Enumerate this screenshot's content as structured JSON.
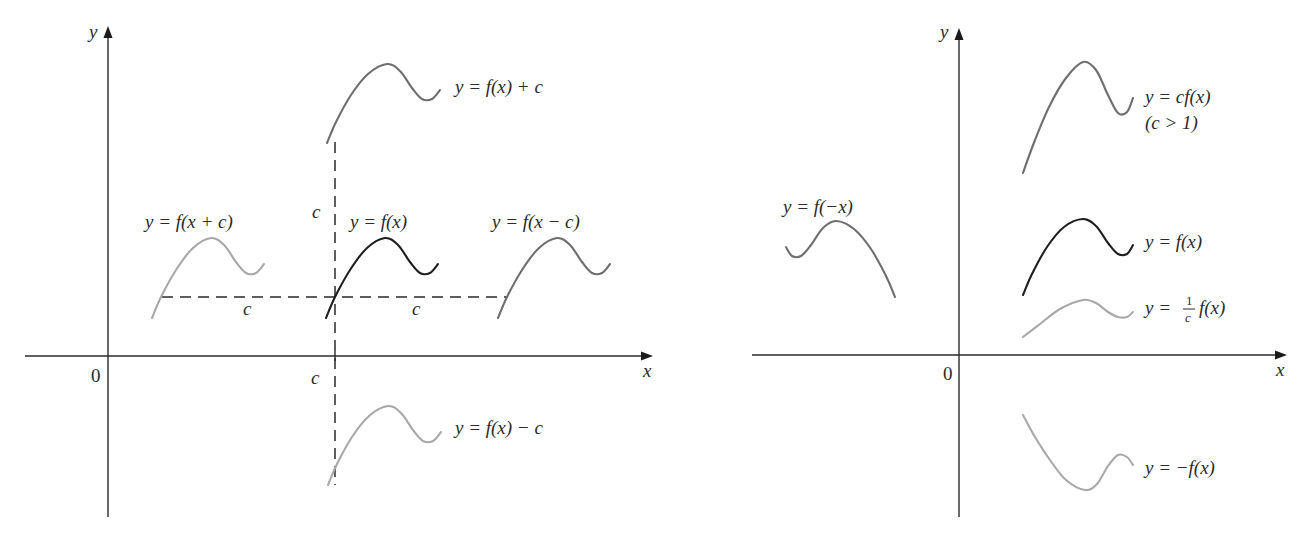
{
  "figure": {
    "left_panel": {
      "y_axis_label": "y",
      "x_axis_label": "x",
      "origin_label": "0",
      "labels": {
        "f_x_plus_c": "y = f(x + c)",
        "f_x": "y = f(x)",
        "f_x_minus_c": "y = f(x − c)",
        "f_plus_c": "y = f(x) + c",
        "f_minus_c": "y = f(x) − c",
        "shift_vertical_c": "c",
        "shift_left_c": "c",
        "shift_right_c": "c",
        "axis_c": "c"
      }
    },
    "right_panel": {
      "y_axis_label": "y",
      "x_axis_label": "x",
      "origin_label": "0",
      "labels": {
        "f_neg_x": "y = f(−x)",
        "cf_x": "y = cf(x)",
        "cf_condition": "(c > 1)",
        "f_x": "y = f(x)",
        "inv_c_prefix": "y =",
        "inv_c_num": "1",
        "inv_c_den": "c",
        "inv_c_suffix": "f(x)",
        "neg_f_x": "y = −f(x)"
      }
    },
    "colors": {
      "axis": "#2a2a2a",
      "base_curve": "#1e1e1e",
      "medium_curve": "#6e6e6e",
      "light_curve": "#a8a8a8",
      "text": "#2b2b2b"
    }
  },
  "chart_data": [
    {
      "type": "line",
      "title": "Vertical and horizontal shifts of y = f(x)",
      "xlabel": "x",
      "ylabel": "y",
      "grid": false,
      "units": "pixel coordinates (schematic, no numeric scale)",
      "axes": {
        "origin": [
          108,
          356
        ],
        "x_range_px": [
          25,
          652
        ],
        "y_range_px": [
          517,
          28
        ]
      },
      "guides": {
        "horizontal_dashed": {
          "y": 297,
          "x1": 162,
          "x2": 508,
          "labels": [
            "c",
            "c"
          ]
        },
        "vertical_dashed": {
          "x": 335,
          "y1": 142,
          "y2": 485,
          "labels": [
            "c",
            "c"
          ]
        }
      },
      "series": [
        {
          "name": "y = f(x)",
          "color": "#1e1e1e",
          "points": [
            [
              326,
              318
            ],
            [
              335,
              297
            ],
            [
              350,
              270
            ],
            [
              367,
              248
            ],
            [
              385,
              238
            ],
            [
              398,
              245
            ],
            [
              410,
              262
            ],
            [
              420,
              273
            ],
            [
              430,
              273
            ],
            [
              438,
              264
            ]
          ]
        },
        {
          "name": "y = f(x + c)",
          "color": "#a8a8a8",
          "points": [
            [
              152,
              318
            ],
            [
              161,
              297
            ],
            [
              176,
              270
            ],
            [
              193,
              248
            ],
            [
              211,
              238
            ],
            [
              224,
              245
            ],
            [
              236,
              262
            ],
            [
              246,
              273
            ],
            [
              256,
              273
            ],
            [
              264,
              264
            ]
          ]
        },
        {
          "name": "y = f(x − c)",
          "color": "#6e6e6e",
          "points": [
            [
              498,
              318
            ],
            [
              507,
              297
            ],
            [
              522,
              270
            ],
            [
              539,
              248
            ],
            [
              557,
              238
            ],
            [
              570,
              245
            ],
            [
              582,
              262
            ],
            [
              592,
              273
            ],
            [
              602,
              273
            ],
            [
              610,
              264
            ]
          ]
        },
        {
          "name": "y = f(x) + c",
          "color": "#6e6e6e",
          "points": [
            [
              327,
              143
            ],
            [
              336,
              122
            ],
            [
              351,
              95
            ],
            [
              368,
              74
            ],
            [
              387,
              64
            ],
            [
              400,
              71
            ],
            [
              412,
              88
            ],
            [
              422,
              99
            ],
            [
              432,
              99
            ],
            [
              440,
              90
            ]
          ]
        },
        {
          "name": "y = f(x) − c",
          "color": "#a8a8a8",
          "points": [
            [
              328,
              485
            ],
            [
              337,
              464
            ],
            [
              352,
              437
            ],
            [
              369,
              416
            ],
            [
              388,
              406
            ],
            [
              401,
              413
            ],
            [
              413,
              430
            ],
            [
              423,
              441
            ],
            [
              433,
              441
            ],
            [
              441,
              432
            ]
          ]
        }
      ]
    },
    {
      "type": "line",
      "title": "Reflections and vertical stretching/compression of y = f(x)",
      "xlabel": "x",
      "ylabel": "y",
      "grid": false,
      "units": "pixel coordinates (schematic, no numeric scale)",
      "axes": {
        "origin": [
          959,
          355
        ],
        "x_range_px": [
          752,
          1286
        ],
        "y_range_px": [
          517,
          28
        ]
      },
      "series": [
        {
          "name": "y = f(x)",
          "color": "#1e1e1e",
          "points": [
            [
              1023,
              295
            ],
            [
              1032,
              274
            ],
            [
              1047,
              247
            ],
            [
              1064,
              227
            ],
            [
              1083,
              219
            ],
            [
              1096,
              226
            ],
            [
              1108,
              243
            ],
            [
              1118,
              254
            ],
            [
              1127,
              254
            ],
            [
              1133,
              245
            ]
          ]
        },
        {
          "name": "y = cf(x) (c > 1)",
          "color": "#6e6e6e",
          "points": [
            [
              1023,
              173
            ],
            [
              1035,
              140
            ],
            [
              1050,
              105
            ],
            [
              1066,
              78
            ],
            [
              1083,
              62
            ],
            [
              1096,
              70
            ],
            [
              1108,
              95
            ],
            [
              1118,
              113
            ],
            [
              1127,
              112
            ],
            [
              1133,
              98
            ]
          ]
        },
        {
          "name": "y = (1/c) f(x)",
          "color": "#a8a8a8",
          "points": [
            [
              1023,
              337
            ],
            [
              1040,
              324
            ],
            [
              1060,
              309
            ],
            [
              1083,
              300
            ],
            [
              1096,
              303
            ],
            [
              1108,
              312
            ],
            [
              1118,
              317
            ],
            [
              1127,
              317
            ],
            [
              1133,
              312
            ]
          ]
        },
        {
          "name": "y = −f(x)",
          "color": "#a8a8a8",
          "points": [
            [
              1023,
              415
            ],
            [
              1035,
              437
            ],
            [
              1050,
              460
            ],
            [
              1066,
              480
            ],
            [
              1085,
              490
            ],
            [
              1097,
              484
            ],
            [
              1108,
              466
            ],
            [
              1118,
              455
            ],
            [
              1127,
              457
            ],
            [
              1133,
              465
            ]
          ]
        },
        {
          "name": "y = f(−x)",
          "color": "#6e6e6e",
          "points": [
            [
              895,
              297
            ],
            [
              886,
              276
            ],
            [
              871,
              249
            ],
            [
              854,
              229
            ],
            [
              836,
              221
            ],
            [
              823,
              228
            ],
            [
              811,
              245
            ],
            [
              801,
              256
            ],
            [
              792,
              256
            ],
            [
              786,
              247
            ]
          ]
        }
      ]
    }
  ]
}
